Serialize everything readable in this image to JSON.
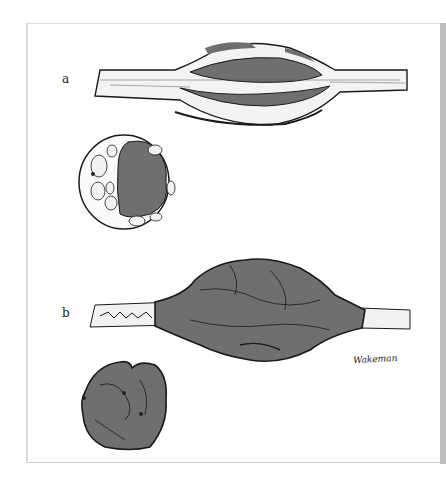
{
  "figure": {
    "panels": [
      {
        "label": "a",
        "description": "Nerve with encapsulated tumor, longitudinal view and cross section"
      },
      {
        "label": "b",
        "description": "Nerve with infiltrating diffuse tumor, longitudinal view and cross section"
      }
    ],
    "signature": "Wakeman",
    "colors": {
      "tumor": "#6f6f6f",
      "nerve": "#f2f2f2",
      "outline": "#1a1a1a",
      "frame": "#d8d8d8"
    }
  }
}
